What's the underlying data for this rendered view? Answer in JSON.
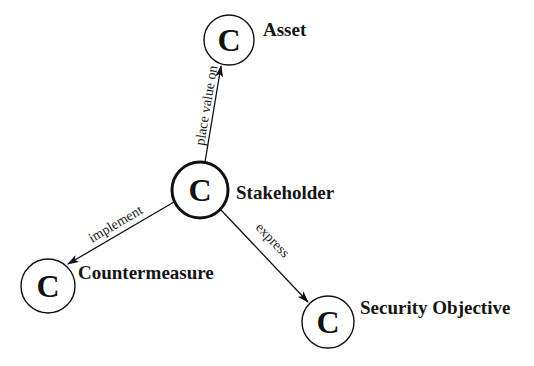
{
  "diagram": {
    "type": "concept-relationship",
    "nodes": [
      {
        "id": "asset",
        "glyph": "C",
        "label": "Asset",
        "cx": 229,
        "cy": 40,
        "r": 25,
        "emphasis": false
      },
      {
        "id": "stakeholder",
        "glyph": "C",
        "label": "Stakeholder",
        "cx": 200,
        "cy": 190,
        "r": 28,
        "emphasis": true
      },
      {
        "id": "countermeasure",
        "glyph": "C",
        "label": "Countermeasure",
        "cx": 48,
        "cy": 286,
        "r": 27,
        "emphasis": false
      },
      {
        "id": "security_objective",
        "glyph": "C",
        "label": "Security Objective",
        "cx": 328,
        "cy": 322,
        "r": 26,
        "emphasis": false
      }
    ],
    "edges": [
      {
        "from": "stakeholder",
        "to": "asset",
        "label": "place value on"
      },
      {
        "from": "stakeholder",
        "to": "countermeasure",
        "label": "implement"
      },
      {
        "from": "stakeholder",
        "to": "security_objective",
        "label": "express"
      }
    ],
    "colors": {
      "stroke": "#111111",
      "background": "#ffffff"
    }
  }
}
